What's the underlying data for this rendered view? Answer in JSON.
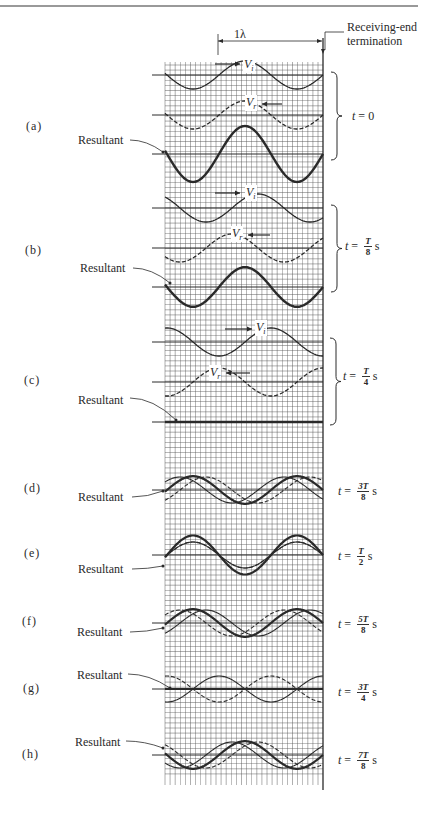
{
  "figure": {
    "top_rule": true,
    "header": {
      "wavelength_label": "1λ",
      "termination_label_line1": "Receiving-end",
      "termination_label_line2": "termination"
    },
    "resultant_label": "Resultant",
    "incident_label": "V",
    "incident_sub": "i",
    "reflected_label": "V",
    "reflected_sub": "r",
    "panels": [
      {
        "id": "(a)",
        "t_prefix": "t",
        "t_num": "",
        "t_den": "",
        "t_plain": "0",
        "t_unit": ""
      },
      {
        "id": "(b)",
        "t_prefix": "t",
        "t_num": "T",
        "t_den": "8",
        "t_plain": "",
        "t_unit": "s"
      },
      {
        "id": "(c)",
        "t_prefix": "t",
        "t_num": "T",
        "t_den": "4",
        "t_plain": "",
        "t_unit": "s"
      },
      {
        "id": "(d)",
        "t_prefix": "t",
        "t_num": "3T",
        "t_den": "8",
        "t_plain": "",
        "t_unit": "s"
      },
      {
        "id": "(e)",
        "t_prefix": "t",
        "t_num": "T",
        "t_den": "2",
        "t_plain": "",
        "t_unit": "s"
      },
      {
        "id": "(f)",
        "t_prefix": "t",
        "t_num": "5T",
        "t_den": "8",
        "t_plain": "",
        "t_unit": "s"
      },
      {
        "id": "(g)",
        "t_prefix": "t",
        "t_num": "3T",
        "t_den": "4",
        "t_plain": "",
        "t_unit": "s"
      },
      {
        "id": "(h)",
        "t_prefix": "t",
        "t_num": "7T",
        "t_den": "8",
        "t_plain": "",
        "t_unit": "s"
      }
    ],
    "colors": {
      "ink": "#2a2a2a",
      "grid": "#555555",
      "background": "#ffffff"
    }
  },
  "chart_data": {
    "type": "line",
    "xlabel": "Position along line (1λ shown, receiving end at right)",
    "ylabel": "Voltage",
    "grid": true,
    "x_range_wavelengths": [
      0,
      1.5
    ],
    "panels": [
      {
        "label": "(a)",
        "t": "0",
        "incident_phase_deg": 0,
        "reflected_phase_deg": 0,
        "resultant_amplitude": 2.0,
        "layout": "separate"
      },
      {
        "label": "(b)",
        "t": "T/8",
        "incident_phase_deg": 45,
        "reflected_phase_deg": -45,
        "resultant_amplitude": 1.414,
        "layout": "separate"
      },
      {
        "label": "(c)",
        "t": "T/4",
        "incident_phase_deg": 90,
        "reflected_phase_deg": -90,
        "resultant_amplitude": 0.0,
        "layout": "separate"
      },
      {
        "label": "(d)",
        "t": "3T/8",
        "incident_phase_deg": 135,
        "reflected_phase_deg": -135,
        "resultant_amplitude": 1.414,
        "layout": "overlaid"
      },
      {
        "label": "(e)",
        "t": "T/2",
        "incident_phase_deg": 180,
        "reflected_phase_deg": -180,
        "resultant_amplitude": 2.0,
        "layout": "overlaid"
      },
      {
        "label": "(f)",
        "t": "5T/8",
        "incident_phase_deg": 225,
        "reflected_phase_deg": -225,
        "resultant_amplitude": 1.414,
        "layout": "overlaid"
      },
      {
        "label": "(g)",
        "t": "3T/4",
        "incident_phase_deg": 270,
        "reflected_phase_deg": -270,
        "resultant_amplitude": 0.0,
        "layout": "overlaid"
      },
      {
        "label": "(h)",
        "t": "7T/8",
        "incident_phase_deg": 315,
        "reflected_phase_deg": -315,
        "resultant_amplitude": 1.414,
        "layout": "overlaid"
      }
    ],
    "legend": [
      "V_i (incident, solid thin)",
      "V_r (reflected, dashed)",
      "Resultant (solid thick)"
    ]
  }
}
